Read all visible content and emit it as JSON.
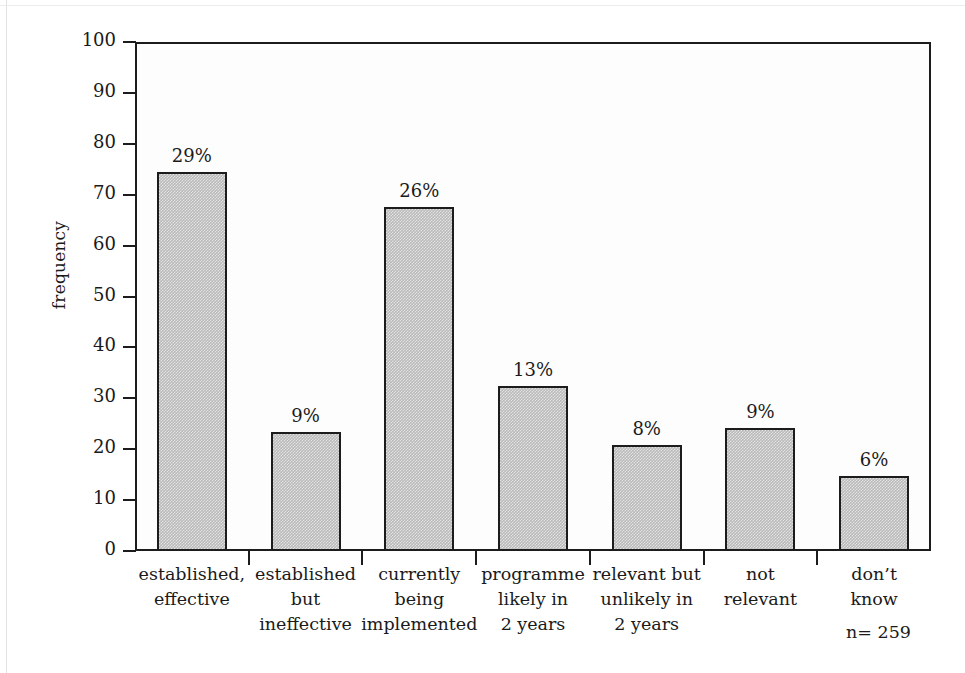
{
  "chart_data": {
    "type": "bar",
    "title": "",
    "xlabel": "",
    "ylabel": "frequency",
    "ylim": [
      0,
      100
    ],
    "grid": false,
    "legend": null,
    "categories": [
      "established,\neffective",
      "established\nbut\nineffective",
      "currently\nbeing\nimplemented",
      "programme\nlikely in\n2 years",
      "relevant but\nunlikely in\n2 years",
      "not\nrelevant",
      "don’t\nknow"
    ],
    "values": [
      74.5,
      23.4,
      67.5,
      32.4,
      20.8,
      24.2,
      14.7
    ],
    "data_labels": [
      "29%",
      "9%",
      "26%",
      "13%",
      "8%",
      "9%",
      "6%"
    ],
    "yticks": [
      0,
      10,
      20,
      30,
      40,
      50,
      60,
      70,
      80,
      90,
      100
    ],
    "ytick_labels": [
      "0",
      "10",
      "20",
      "30",
      "40",
      "50",
      "60",
      "70",
      "80",
      "90",
      "100"
    ],
    "annotations": [
      {
        "name": "sample-size",
        "text": "n= 259"
      }
    ],
    "colors": {
      "bar_fill": "#b9b9b9",
      "bar_border": "#1c1c1c",
      "axis": "#1c1c1c",
      "text": "#1a1a1a",
      "background": "#ffffff"
    }
  }
}
